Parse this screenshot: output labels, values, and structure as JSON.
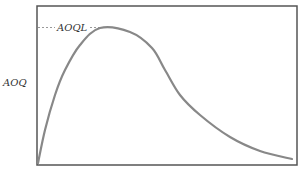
{
  "chart_data": {
    "type": "line",
    "title": "",
    "xlabel": "",
    "ylabel": "AOQ",
    "grid": false,
    "legend": null,
    "annotations": [
      {
        "text": "AOQL",
        "type": "dashed-horizontal-line-to-peak"
      }
    ],
    "series": [
      {
        "name": "AOQ curve",
        "color": "#888888",
        "points_px": [
          [
            38,
            163
          ],
          [
            45,
            130
          ],
          [
            55,
            95
          ],
          [
            65,
            70
          ],
          [
            80,
            45
          ],
          [
            100,
            28
          ],
          [
            130,
            32
          ],
          [
            152,
            48
          ],
          [
            165,
            70
          ],
          [
            180,
            95
          ],
          [
            200,
            115
          ],
          [
            230,
            137
          ],
          [
            260,
            151
          ],
          [
            292,
            159
          ]
        ]
      }
    ],
    "xlim": [
      0,
      1
    ],
    "ylim": [
      0,
      1
    ],
    "shape": "rises steeply from origin to a single maximum (AOQL) at about 25% of x-range, then decays toward zero"
  },
  "labels": {
    "y_axis": "AOQ",
    "peak": "AOQL"
  },
  "colors": {
    "frame": "#555555",
    "curve": "#888888",
    "dashed": "#999999",
    "text": "#333333"
  }
}
